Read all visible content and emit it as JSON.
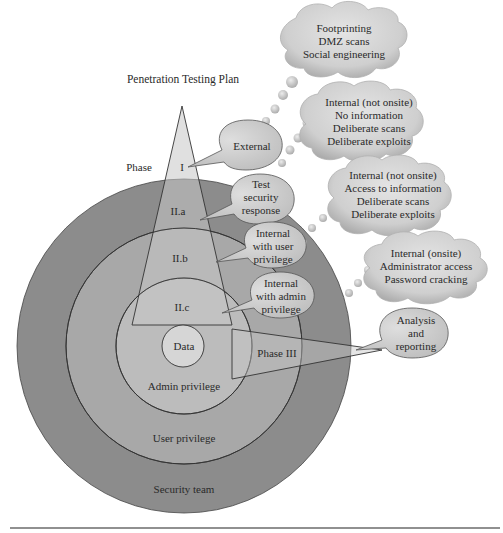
{
  "title": "Penetration Testing Plan",
  "phase_label": "Phase",
  "rings": [
    {
      "id": "security-team",
      "label": "Security team"
    },
    {
      "id": "user-privilege",
      "label": "User privilege"
    },
    {
      "id": "admin-privilege",
      "label": "Admin privilege"
    },
    {
      "id": "data",
      "label": "Data"
    }
  ],
  "phases": [
    {
      "id": "phase-1",
      "label": "I",
      "bubble": [
        "External"
      ],
      "cloud": [
        "Footprinting",
        "DMZ scans",
        "Social engineering"
      ]
    },
    {
      "id": "phase-2a",
      "label": "II.a",
      "bubble": [
        "Test",
        "security",
        "response"
      ],
      "cloud": [
        "Internal (not onsite)",
        "No information",
        "Deliberate scans",
        "Deliberate exploits"
      ]
    },
    {
      "id": "phase-2b",
      "label": "II.b",
      "bubble": [
        "Internal",
        "with user",
        "privilege"
      ],
      "cloud": [
        "Internal (not onsite)",
        "Access to information",
        "Deliberate scans",
        "Deliberate exploits"
      ]
    },
    {
      "id": "phase-2c",
      "label": "II.c",
      "bubble": [
        "Internal",
        "with admin",
        "privilege"
      ],
      "cloud": [
        "Internal (onsite)",
        "Administrator access",
        "Password cracking"
      ]
    },
    {
      "id": "phase-3",
      "label": "Phase III",
      "bubble": [
        "Analysis",
        "and",
        "reporting"
      ],
      "cloud": []
    }
  ],
  "colors": {
    "outer_ring": "#8a8a8a",
    "middle_ring": "#a9a9a9",
    "inner_ring": "#bdbdbd",
    "data_circle": "#d6d6d6",
    "triangle": "#c2c2c2",
    "bubble": "#d0d0d0",
    "cloud": "#c8c8c8",
    "stroke": "#333333"
  }
}
